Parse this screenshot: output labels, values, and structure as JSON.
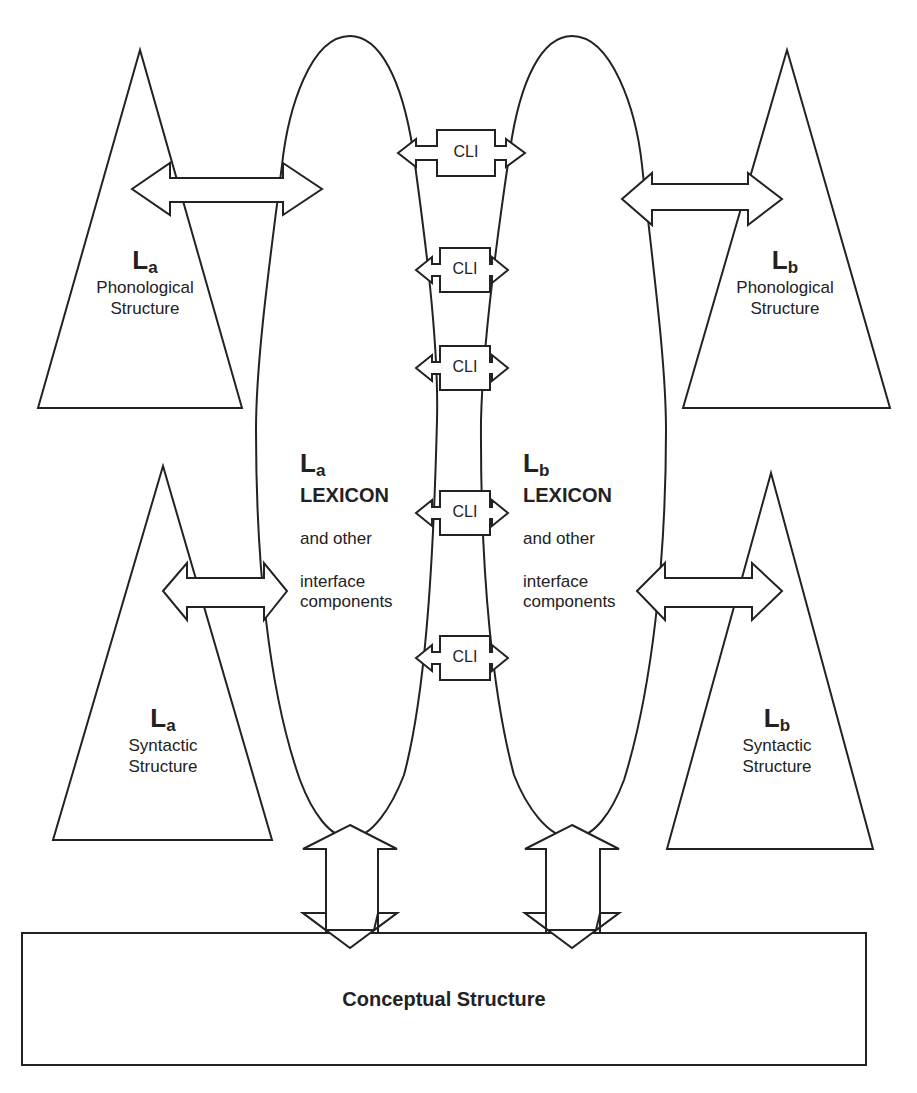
{
  "diagram": {
    "type": "parallel-architecture-bilingual",
    "languages": [
      "La",
      "Lb"
    ],
    "nodes": {
      "la_phonological": {
        "lang_letter": "L",
        "lang_sub": "a",
        "line1": "Phonological",
        "line2": "Structure"
      },
      "lb_phonological": {
        "lang_letter": "L",
        "lang_sub": "b",
        "line1": "Phonological",
        "line2": "Structure"
      },
      "la_syntactic": {
        "lang_letter": "L",
        "lang_sub": "a",
        "line1": "Syntactic",
        "line2": "Structure"
      },
      "lb_syntactic": {
        "lang_letter": "L",
        "lang_sub": "b",
        "line1": "Syntactic",
        "line2": "Structure"
      },
      "la_lexicon": {
        "lang_letter": "L",
        "lang_sub": "a",
        "title": "LEXICON",
        "line1": "and other",
        "line2": "interface",
        "line3": "components"
      },
      "lb_lexicon": {
        "lang_letter": "L",
        "lang_sub": "b",
        "title": "LEXICON",
        "line1": "and other",
        "line2": "interface",
        "line3": "components"
      },
      "conceptual": {
        "label": "Conceptual Structure"
      }
    },
    "cli_boxes": [
      {
        "label": "CLI"
      },
      {
        "label": "CLI"
      },
      {
        "label": "CLI"
      },
      {
        "label": "CLI"
      },
      {
        "label": "CLI"
      }
    ],
    "edges": [
      {
        "from": "la_phonological",
        "to": "la_lexicon",
        "type": "double-arrow"
      },
      {
        "from": "lb_lexicon",
        "to": "lb_phonological",
        "type": "double-arrow"
      },
      {
        "from": "la_syntactic",
        "to": "la_lexicon",
        "type": "double-arrow"
      },
      {
        "from": "lb_lexicon",
        "to": "lb_syntactic",
        "type": "double-arrow"
      },
      {
        "from": "la_lexicon",
        "to": "conceptual",
        "type": "double-arrow"
      },
      {
        "from": "lb_lexicon",
        "to": "conceptual",
        "type": "double-arrow"
      },
      {
        "from": "la_lexicon",
        "to": "lb_lexicon",
        "via": "CLI",
        "count": 5,
        "type": "double-arrow"
      }
    ]
  }
}
